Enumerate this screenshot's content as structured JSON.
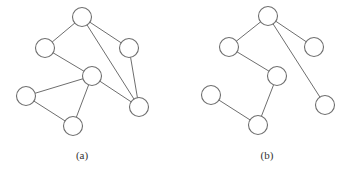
{
  "figure": {
    "graphs": [
      {
        "id": "a",
        "caption": "(a)",
        "nodes": [
          "top",
          "upper-left",
          "upper-right",
          "middle",
          "left",
          "bottom",
          "lower-right"
        ],
        "edges": [
          [
            "top",
            "upper-left"
          ],
          [
            "top",
            "upper-right"
          ],
          [
            "top",
            "lower-right"
          ],
          [
            "upper-left",
            "middle"
          ],
          [
            "upper-right",
            "lower-right"
          ],
          [
            "middle",
            "left"
          ],
          [
            "middle",
            "bottom"
          ],
          [
            "middle",
            "lower-right"
          ],
          [
            "left",
            "bottom"
          ]
        ]
      },
      {
        "id": "b",
        "caption": "(b)",
        "nodes": [
          "top",
          "upper-left",
          "upper-right",
          "middle",
          "left",
          "bottom",
          "lower-right"
        ],
        "edges": [
          [
            "top",
            "upper-left"
          ],
          [
            "top",
            "upper-right"
          ],
          [
            "top",
            "lower-right"
          ],
          [
            "upper-left",
            "middle"
          ],
          [
            "middle",
            "bottom"
          ],
          [
            "left",
            "bottom"
          ]
        ]
      }
    ]
  }
}
